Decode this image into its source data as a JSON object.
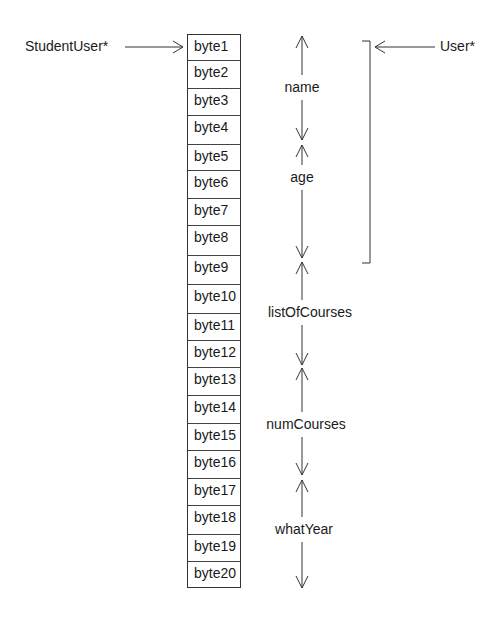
{
  "pointers": {
    "student_user": "StudentUser*",
    "user": "User*"
  },
  "bytes": [
    "byte1",
    "byte2",
    "byte3",
    "byte4",
    "byte5",
    "byte6",
    "byte7",
    "byte8",
    "byte9",
    "byte10",
    "byte11",
    "byte12",
    "byte13",
    "byte14",
    "byte15",
    "byte16",
    "byte17",
    "byte18",
    "byte19",
    "byte20"
  ],
  "fields": {
    "name": "name",
    "age": "age",
    "list_of_courses": "listOfCourses",
    "num_courses": "numCourses",
    "what_year": "whatYear"
  },
  "colors": {
    "line": "#333333",
    "text": "#1a1a1a",
    "background": "#ffffff"
  }
}
